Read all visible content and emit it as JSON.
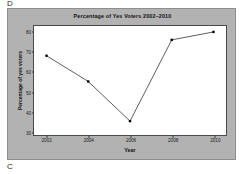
{
  "annotations": {
    "top_letter": "D",
    "bottom_letter": "C"
  },
  "colors": {
    "panel_background": "#b2b2b2",
    "plot_background": "#ffffff",
    "line": "#1a1a1a",
    "marker": "#000000",
    "axis": "#4a4a4a",
    "text": "#111111"
  },
  "chart_data": {
    "type": "line",
    "title": "Percentage of Yes Voters 2002–2010",
    "xlabel": "Year",
    "ylabel": "Percentage of yes voters",
    "categories": [
      "2002",
      "2004",
      "2006",
      "2008",
      "2010"
    ],
    "x": [
      2002,
      2004,
      2006,
      2008,
      2010
    ],
    "values": [
      68,
      55,
      35,
      76,
      80
    ],
    "series": [
      {
        "name": "Percentage of yes voters",
        "values": [
          68,
          55,
          35,
          76,
          80
        ]
      }
    ],
    "xticks": [
      "2002",
      "2004",
      "2006",
      "2008",
      "2010"
    ],
    "yticks": [
      "30",
      "40",
      "50",
      "60",
      "70",
      "80"
    ],
    "ylim": [
      28,
      83
    ],
    "xlim": [
      2001.4,
      2010.6
    ],
    "grid": false,
    "legend": null,
    "marker": "square",
    "marker_size": 2.4
  }
}
